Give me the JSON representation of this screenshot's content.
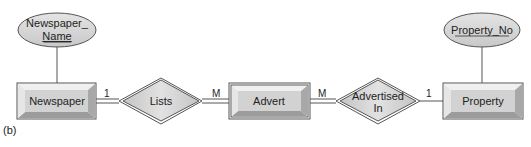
{
  "figure_label": "(b)",
  "entities": [
    {
      "id": "newspaper",
      "label": "Newspaper"
    },
    {
      "id": "advert",
      "label": "Advert"
    },
    {
      "id": "property",
      "label": "Property"
    }
  ],
  "relationships": [
    {
      "id": "lists",
      "label": "Lists"
    },
    {
      "id": "advertised_in",
      "label_line1": "Advertised",
      "label_line2": "In"
    }
  ],
  "attributes": [
    {
      "id": "newspaper_name",
      "line1": "Newspaper_",
      "line2": "Name",
      "key": true
    },
    {
      "id": "property_no",
      "label": "Property_No",
      "key": true
    }
  ],
  "cardinalities": {
    "newspaper_lists": "1",
    "lists_advert": "M",
    "advert_advertised": "M",
    "advertised_property": "1"
  },
  "colors": {
    "fill": "#d4d4d4",
    "stroke": "#555555",
    "bevel_light": "#efefef",
    "bevel_dark": "#9a9a9a"
  }
}
